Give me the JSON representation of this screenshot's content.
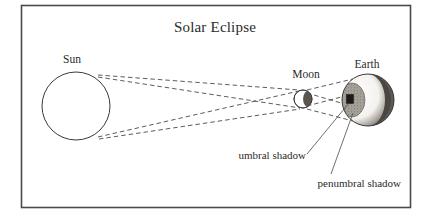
{
  "figure": {
    "title": "Solar Eclipse",
    "type": "astronomy-diagram",
    "frame": {
      "border_color": "#4a4a4a",
      "background": "#ffffff"
    }
  },
  "labels": {
    "sun": "Sun",
    "moon": "Moon",
    "earth": "Earth",
    "umbral_shadow": "umbral shadow",
    "penumbral_shadow": "penumbral shadow"
  },
  "bodies": [
    {
      "name": "sun",
      "label": "Sun",
      "shape": "circle",
      "cx": 76,
      "cy": 106,
      "r": 34,
      "fill": "#ffffff",
      "stroke": "#3a3a3a"
    },
    {
      "name": "moon",
      "label": "Moon",
      "shape": "circle",
      "cx": 303,
      "cy": 99,
      "r": 9,
      "fill": "#ffffff",
      "stroke": "#3a3a3a",
      "shaded_side": "right"
    },
    {
      "name": "earth",
      "label": "Earth",
      "shape": "circle",
      "cx": 368,
      "cy": 100,
      "r": 26,
      "fill": "#ffffff",
      "stroke": "#3a3a3a",
      "shaded_side": "right",
      "night_crescent_fill": "#4b4642"
    }
  ],
  "shadows": [
    {
      "name": "penumbral-shadow",
      "label": "penumbral shadow",
      "cx": 352,
      "cy": 100,
      "rx": 13,
      "ry": 17,
      "fill": "#9b978f"
    },
    {
      "name": "umbral-shadow",
      "label": "umbral shadow",
      "cx": 350,
      "cy": 99,
      "w": 7,
      "h": 9,
      "fill": "#1e1c1a"
    }
  ],
  "rays": {
    "style": "dashed",
    "color": "#4a4a4a",
    "description": "tangent light rays from Sun limbs past Moon onto Earth",
    "lines": [
      {
        "name": "ray-sun-top-to-moon-top",
        "x1": 98,
        "y1": 75,
        "x2": 299,
        "y2": 90
      },
      {
        "name": "ray-sun-top-to-moon-bottom",
        "x1": 98,
        "y1": 76,
        "x2": 300,
        "y2": 108
      },
      {
        "name": "ray-sun-bottom-to-moon-top",
        "x1": 98,
        "y1": 137,
        "x2": 299,
        "y2": 91
      },
      {
        "name": "ray-sun-bottom-to-moon-bottom",
        "x1": 99,
        "y1": 138,
        "x2": 300,
        "y2": 109
      },
      {
        "name": "ray-moon-top-to-earth-upper",
        "x1": 307,
        "y1": 91,
        "x2": 352,
        "y2": 80
      },
      {
        "name": "ray-moon-top-to-earth-lower",
        "x1": 307,
        "y1": 92,
        "x2": 349,
        "y2": 104
      },
      {
        "name": "ray-moon-bottom-to-earth-upper",
        "x1": 307,
        "y1": 107,
        "x2": 350,
        "y2": 96
      },
      {
        "name": "ray-moon-bottom-to-earth-lower",
        "x1": 307,
        "y1": 108,
        "x2": 352,
        "y2": 121
      }
    ]
  },
  "leader_lines": [
    {
      "name": "leader-umbral",
      "x1": 307,
      "y1": 152,
      "x2": 348,
      "y2": 103
    },
    {
      "name": "leader-penumbral",
      "x1": 330,
      "y1": 175,
      "x2": 352,
      "y2": 114
    }
  ],
  "text_positions": {
    "title": {
      "x": 215,
      "y": 32,
      "anchor": "middle"
    },
    "sun": {
      "x": 72,
      "y": 63,
      "anchor": "middle"
    },
    "moon": {
      "x": 306,
      "y": 78,
      "anchor": "middle"
    },
    "earth": {
      "x": 367,
      "y": 68,
      "anchor": "middle"
    },
    "umbral_shadow": {
      "x": 305,
      "y": 159,
      "anchor": "end"
    },
    "penumbral_shadow": {
      "x": 400,
      "y": 187,
      "anchor": "end"
    }
  }
}
